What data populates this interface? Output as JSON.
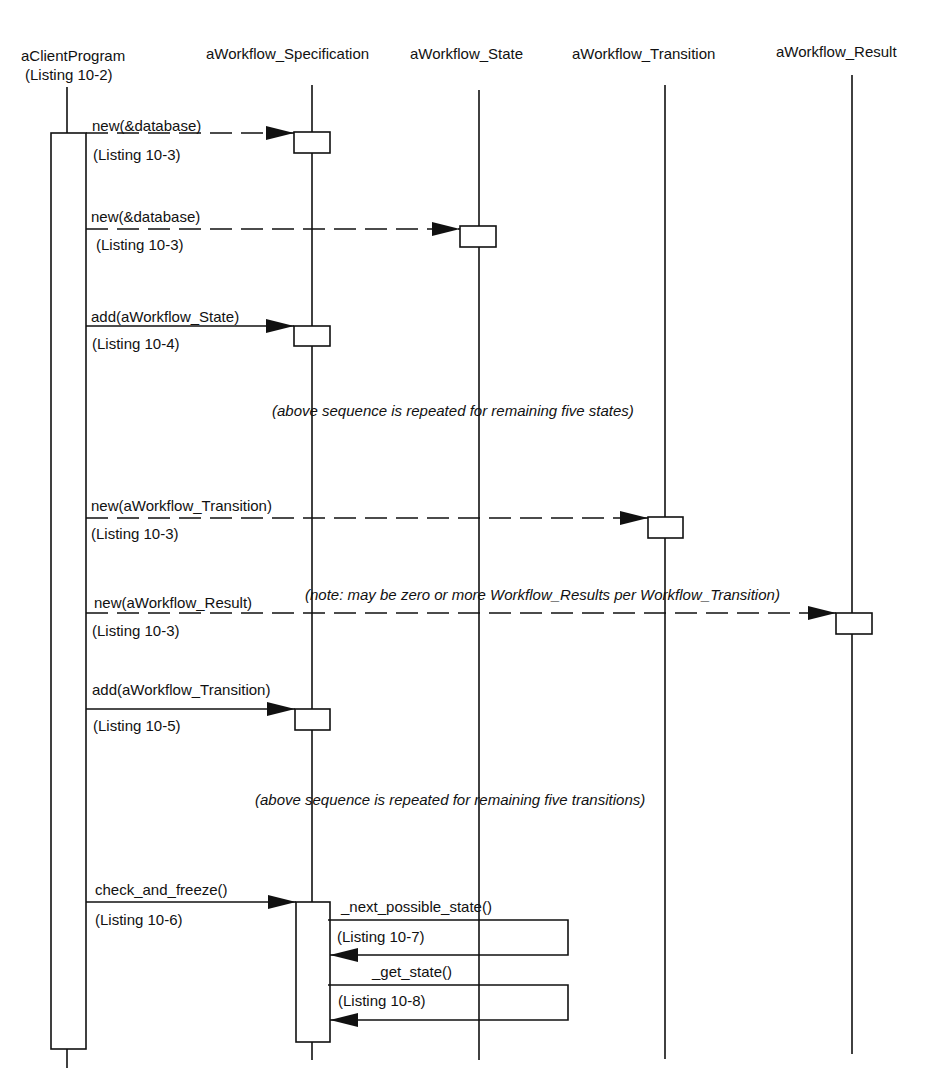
{
  "diagram": {
    "type": "sequence",
    "title_cut": "",
    "lifelines": [
      {
        "id": "client",
        "name": "aClientProgram",
        "subtitle": "(Listing 10-2)",
        "x": 67
      },
      {
        "id": "spec",
        "name": "aWorkflow_Specification",
        "x": 312
      },
      {
        "id": "state",
        "name": "aWorkflow_State",
        "x": 479
      },
      {
        "id": "transition",
        "name": "aWorkflow_Transition",
        "x": 665
      },
      {
        "id": "result",
        "name": "aWorkflow_Result",
        "x": 852
      }
    ],
    "messages": [
      {
        "id": "m1",
        "label": "new(&database)",
        "ref": "(Listing 10-3)",
        "from": "client",
        "to": "spec",
        "style": "dashed"
      },
      {
        "id": "m2",
        "label": "new(&database)",
        "ref": "(Listing 10-3)",
        "from": "client",
        "to": "state",
        "style": "dashed"
      },
      {
        "id": "m3",
        "label": "add(aWorkflow_State)",
        "ref": "(Listing 10-4)",
        "from": "client",
        "to": "spec",
        "style": "solid"
      },
      {
        "id": "m4",
        "label": "new(aWorkflow_Transition)",
        "ref": "(Listing 10-3)",
        "from": "client",
        "to": "transition",
        "style": "dashed"
      },
      {
        "id": "m5",
        "label": "new(aWorkflow_Result)",
        "ref": "(Listing 10-3)",
        "from": "client",
        "to": "result",
        "style": "dashed"
      },
      {
        "id": "m6",
        "label": "add(aWorkflow_Transition)",
        "ref": "(Listing 10-5)",
        "from": "client",
        "to": "spec",
        "style": "solid"
      },
      {
        "id": "m7",
        "label": "check_and_freeze()",
        "ref": "(Listing 10-6)",
        "from": "client",
        "to": "spec",
        "style": "solid"
      },
      {
        "id": "m8",
        "label": "_next_possible_state()",
        "ref": "(Listing 10-7)",
        "from": "spec",
        "to": "spec",
        "style": "self"
      },
      {
        "id": "m9",
        "label": "_get_state()",
        "ref": "(Listing 10-8)",
        "from": "spec",
        "to": "spec",
        "style": "self"
      }
    ],
    "notes": [
      {
        "id": "n1",
        "text": "(above sequence is repeated for remaining five states)"
      },
      {
        "id": "n2",
        "text": "(note: may be zero or more Workflow_Results per Workflow_Transition)"
      },
      {
        "id": "n3",
        "text": "(above sequence is repeated for remaining five transitions)"
      }
    ],
    "colors": {
      "line": "#111111",
      "background": "#ffffff"
    }
  }
}
